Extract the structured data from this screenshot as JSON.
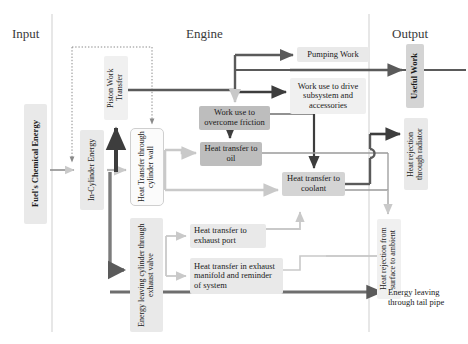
{
  "diagram": {
    "title_sections": [
      {
        "label": "Input",
        "x": 12,
        "y": 28
      },
      {
        "label": "Engine",
        "x": 186,
        "y": 28
      },
      {
        "label": "Output",
        "x": 392,
        "y": 28
      }
    ],
    "colors": {
      "arrow_dark": "#5a5a5a",
      "arrow_light": "#c9c9c9",
      "arrow_black": "#3d3d3d",
      "divider": "#cccccc",
      "box_dark": "#bdbdbd",
      "box_mid": "#d4d4d4",
      "box_light": "#e9e9e9",
      "box_pale": "#f0f0f0",
      "text": "#1a1a1a",
      "background": "#ffffff"
    },
    "dividers": [
      {
        "name": "input-engine-divider",
        "x": 52
      },
      {
        "name": "engine-output-divider",
        "x": 369
      }
    ],
    "nodes": [
      {
        "id": "fuel",
        "label": "Fuel's Chemical Energy",
        "vertical": true,
        "bold": true,
        "x": 24,
        "y": 104,
        "w": 23,
        "h": 120,
        "fill": "fill-light",
        "round": "round-sm",
        "fontSize": 8.5
      },
      {
        "id": "in-cylinder",
        "label": "In-Cylinder Energy",
        "vertical": true,
        "bold": false,
        "x": 80,
        "y": 130,
        "w": 24,
        "h": 80,
        "fill": "fill-light",
        "round": "round-sm",
        "fontSize": 8
      },
      {
        "id": "piston-work",
        "label": "Piston Work Transfer",
        "vertical": true,
        "bold": false,
        "x": 104,
        "y": 56,
        "w": 24,
        "h": 64,
        "fill": "fill-pale",
        "round": "round-sm",
        "fontSize": 8
      },
      {
        "id": "cylinder-wall",
        "label": "Heat Transfer through cylinder wall",
        "vertical": true,
        "bold": false,
        "x": 130,
        "y": 128,
        "w": 34,
        "h": 78,
        "fill": "outline-light",
        "round": "round-md",
        "fontSize": 8
      },
      {
        "id": "exhaust-valve",
        "label": "Energy leaving cylinder through exhaust valve",
        "vertical": true,
        "bold": false,
        "x": 130,
        "y": 218,
        "w": 33,
        "h": 114,
        "fill": "fill-light",
        "round": "round-sm",
        "fontSize": 8
      },
      {
        "id": "pumping-work",
        "label": "Pumping Work",
        "vertical": false,
        "bold": false,
        "x": 297,
        "y": 47,
        "w": 72,
        "h": 14,
        "fill": "fill-light",
        "round": "round-sm",
        "fontSize": 8.5
      },
      {
        "id": "drive-subsystem",
        "label": "Work use to drive subsystem and accessories",
        "vertical": false,
        "bold": false,
        "x": 290,
        "y": 78,
        "w": 76,
        "h": 36,
        "fill": "fill-pale",
        "round": "round-sm",
        "fontSize": 8.5
      },
      {
        "id": "overcome-friction",
        "label": "Work use to overcome friction",
        "vertical": false,
        "bold": false,
        "x": 199,
        "y": 106,
        "w": 71,
        "h": 24,
        "fill": "fill-dark",
        "round": "round-sm",
        "fontSize": 8.5
      },
      {
        "id": "heat-oil",
        "label": "Heat transfer to oil",
        "vertical": false,
        "bold": false,
        "x": 200,
        "y": 142,
        "w": 62,
        "h": 24,
        "fill": "fill-dark",
        "round": "round-sm",
        "fontSize": 8.5
      },
      {
        "id": "heat-coolant",
        "label": "Heat transfer to coolant",
        "vertical": false,
        "bold": false,
        "x": 282,
        "y": 172,
        "w": 63,
        "h": 24,
        "fill": "fill-mid",
        "round": "round-sm",
        "fontSize": 8.5
      },
      {
        "id": "exhaust-port",
        "label": "Heat transfer to exhaust port",
        "vertical": false,
        "bold": false,
        "x": 190,
        "y": 224,
        "w": 76,
        "h": 24,
        "fill": "fill-light",
        "round": "round-sm",
        "fontSize": 8.5
      },
      {
        "id": "exhaust-manifold",
        "label": "Heat transfer in exhaust manifold and reminder of system",
        "vertical": false,
        "bold": false,
        "x": 190,
        "y": 258,
        "w": 93,
        "h": 36,
        "fill": "fill-light",
        "round": "round-sm",
        "fontSize": 8.5
      },
      {
        "id": "useful-work",
        "label": "Useful Work",
        "vertical": true,
        "bold": true,
        "x": 406,
        "y": 44,
        "w": 18,
        "h": 64,
        "fill": "fill-mid",
        "round": "round-sm",
        "fontSize": 8.5
      },
      {
        "id": "radiator",
        "label": "Heat rejection through radiator",
        "vertical": true,
        "bold": false,
        "x": 404,
        "y": 118,
        "w": 24,
        "h": 72,
        "fill": "fill-light",
        "round": "round-sm",
        "fontSize": 8
      },
      {
        "id": "surface-ambient",
        "label": "Heat rejection from surface to ambient",
        "vertical": true,
        "bold": false,
        "x": 377,
        "y": 219,
        "w": 24,
        "h": 80,
        "fill": "fill-pale",
        "round": "round-sm",
        "fontSize": 8
      }
    ],
    "plain_labels": [
      {
        "id": "tail-pipe",
        "label": "Energy leaving through tail pipe",
        "x": 388,
        "y": 298,
        "w": 78,
        "fontSize": 8.5
      }
    ]
  }
}
